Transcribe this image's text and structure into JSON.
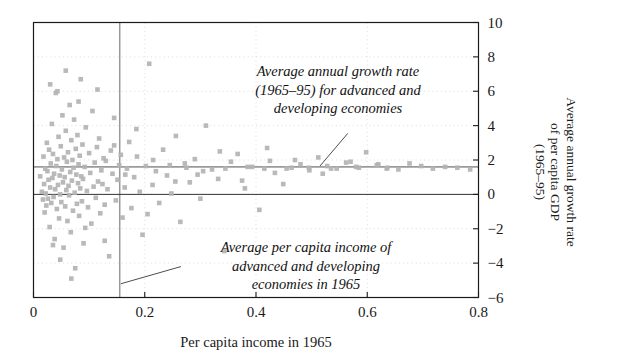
{
  "chart_data": {
    "type": "scatter",
    "title": "",
    "xlabel": "Per capita income in 1965",
    "ylabel": "Average annual growth rate\nof per capita GDP\n(1965–95)",
    "xlim": [
      0,
      0.8
    ],
    "ylim": [
      -6,
      10
    ],
    "xticks": [
      "0",
      "0.2",
      "0.4",
      "0.6",
      "0.8"
    ],
    "xtick_values": [
      0,
      0.2,
      0.4,
      0.6,
      0.8
    ],
    "yticks": [
      "10",
      "8",
      "6",
      "4",
      "2",
      "0",
      "−2",
      "−4",
      "−6"
    ],
    "ytick_values": [
      10,
      8,
      6,
      4,
      2,
      0,
      -2,
      -4,
      -6
    ],
    "grid": "dotted-faint",
    "y_axis_position": "right",
    "marker": "square",
    "marker_color": "#b3b3b3",
    "marker_size": 4.6,
    "reference_lines": [
      {
        "name": "mean-growth-rate-line",
        "orientation": "horizontal",
        "value": 1.6,
        "color": "#9a9a9a"
      },
      {
        "name": "mean-per-capita-income-line",
        "orientation": "vertical",
        "value": 0.155,
        "color": "#9a9a9a"
      },
      {
        "name": "zero-growth-line",
        "orientation": "horizontal",
        "value": 0,
        "color": "#333333"
      }
    ],
    "annotations": [
      {
        "name": "growth-rate-annotation",
        "text": "Average annual growth rate\n(1965–95) for advanced and\ndeveloping economies",
        "leader_from": [
          0.565,
          3.55
        ],
        "leader_to": [
          0.515,
          1.65
        ]
      },
      {
        "name": "income-annotation",
        "text": "Average per capita income of\nadvanced and developing\neconomies in 1965",
        "leader_from": [
          0.265,
          -4.2
        ],
        "leader_to": [
          0.157,
          -5.2
        ]
      }
    ],
    "points": [
      [
        0.012,
        1.05
      ],
      [
        0.015,
        0.15
      ],
      [
        0.017,
        -0.3
      ],
      [
        0.018,
        2.2
      ],
      [
        0.019,
        0.6
      ],
      [
        0.02,
        -1.05
      ],
      [
        0.021,
        1.5
      ],
      [
        0.022,
        0.05
      ],
      [
        0.023,
        -0.65
      ],
      [
        0.024,
        3.0
      ],
      [
        0.025,
        1.35
      ],
      [
        0.026,
        -0.25
      ],
      [
        0.027,
        0.85
      ],
      [
        0.028,
        2.6
      ],
      [
        0.029,
        -1.9
      ],
      [
        0.03,
        0.4
      ],
      [
        0.031,
        1.8
      ],
      [
        0.032,
        -0.5
      ],
      [
        0.033,
        4.1
      ],
      [
        0.034,
        0.95
      ],
      [
        0.035,
        2.35
      ],
      [
        0.036,
        -0.15
      ],
      [
        0.037,
        1.2
      ],
      [
        0.038,
        -2.6
      ],
      [
        0.039,
        0.3
      ],
      [
        0.04,
        5.9
      ],
      [
        0.041,
        1.65
      ],
      [
        0.042,
        -0.85
      ],
      [
        0.043,
        2.05
      ],
      [
        0.044,
        0.55
      ],
      [
        0.045,
        3.35
      ],
      [
        0.046,
        -1.4
      ],
      [
        0.047,
        1.1
      ],
      [
        0.048,
        0.0
      ],
      [
        0.049,
        2.8
      ],
      [
        0.05,
        -0.45
      ],
      [
        0.051,
        1.45
      ],
      [
        0.052,
        4.6
      ],
      [
        0.053,
        0.7
      ],
      [
        0.054,
        -3.1
      ],
      [
        0.055,
        2.15
      ],
      [
        0.056,
        1.0
      ],
      [
        0.057,
        -0.7
      ],
      [
        0.058,
        3.7
      ],
      [
        0.059,
        0.25
      ],
      [
        0.06,
        1.9
      ],
      [
        0.061,
        -1.55
      ],
      [
        0.062,
        2.45
      ],
      [
        0.063,
        0.5
      ],
      [
        0.064,
        -0.05
      ],
      [
        0.065,
        5.2
      ],
      [
        0.066,
        1.3
      ],
      [
        0.067,
        -2.2
      ],
      [
        0.068,
        3.15
      ],
      [
        0.069,
        0.8
      ],
      [
        0.07,
        2.0
      ],
      [
        0.071,
        -0.95
      ],
      [
        0.072,
        1.55
      ],
      [
        0.073,
        4.35
      ],
      [
        0.074,
        0.1
      ],
      [
        0.075,
        -4.3
      ],
      [
        0.076,
        2.65
      ],
      [
        0.077,
        1.15
      ],
      [
        0.078,
        -0.55
      ],
      [
        0.079,
        3.45
      ],
      [
        0.08,
        0.65
      ],
      [
        0.081,
        1.75
      ],
      [
        0.082,
        -1.25
      ],
      [
        0.083,
        2.25
      ],
      [
        0.084,
        0.35
      ],
      [
        0.085,
        6.7
      ],
      [
        0.086,
        1.05
      ],
      [
        0.087,
        -0.4
      ],
      [
        0.088,
        2.9
      ],
      [
        0.089,
        0.9
      ],
      [
        0.09,
        -2.85
      ],
      [
        0.092,
        1.6
      ],
      [
        0.094,
        3.9
      ],
      [
        0.096,
        0.2
      ],
      [
        0.098,
        -0.75
      ],
      [
        0.1,
        2.4
      ],
      [
        0.102,
        1.25
      ],
      [
        0.104,
        -1.7
      ],
      [
        0.106,
        4.85
      ],
      [
        0.108,
        0.45
      ],
      [
        0.11,
        1.85
      ],
      [
        0.112,
        -0.2
      ],
      [
        0.114,
        2.75
      ],
      [
        0.116,
        0.75
      ],
      [
        0.118,
        3.25
      ],
      [
        0.12,
        -1.1
      ],
      [
        0.122,
        1.4
      ],
      [
        0.124,
        0.6
      ],
      [
        0.126,
        2.1
      ],
      [
        0.128,
        -0.6
      ],
      [
        0.13,
        1.95
      ],
      [
        0.133,
        0.3
      ],
      [
        0.136,
        -3.6
      ],
      [
        0.139,
        2.55
      ],
      [
        0.142,
        1.2
      ],
      [
        0.145,
        4.45
      ],
      [
        0.148,
        -0.35
      ],
      [
        0.151,
        0.85
      ],
      [
        0.154,
        1.7
      ],
      [
        0.157,
        2.3
      ],
      [
        0.16,
        -1.35
      ],
      [
        0.164,
        0.4
      ],
      [
        0.168,
        1.5
      ],
      [
        0.172,
        3.05
      ],
      [
        0.176,
        -0.8
      ],
      [
        0.181,
        1.0
      ],
      [
        0.186,
        2.2
      ],
      [
        0.191,
        0.15
      ],
      [
        0.196,
        -2.35
      ],
      [
        0.202,
        1.65
      ],
      [
        0.208,
        7.6
      ],
      [
        0.214,
        0.55
      ],
      [
        0.22,
        1.35
      ],
      [
        0.226,
        -0.5
      ],
      [
        0.233,
        2.6
      ],
      [
        0.24,
        1.1
      ],
      [
        0.248,
        0.05
      ],
      [
        0.256,
        3.4
      ],
      [
        0.264,
        -1.6
      ],
      [
        0.272,
        1.8
      ],
      [
        0.281,
        0.7
      ],
      [
        0.29,
        2.05
      ],
      [
        0.3,
        -0.25
      ],
      [
        0.31,
        4.0
      ],
      [
        0.321,
        1.45
      ],
      [
        0.332,
        0.9
      ],
      [
        0.343,
        -3.3
      ],
      [
        0.355,
        1.9
      ],
      [
        0.367,
        2.35
      ],
      [
        0.38,
        0.35
      ],
      [
        0.393,
        1.6
      ],
      [
        0.406,
        -0.9
      ],
      [
        0.42,
        2.7
      ],
      [
        0.434,
        1.25
      ],
      [
        0.449,
        0.6
      ],
      [
        0.464,
        1.55
      ],
      [
        0.48,
        1.75
      ],
      [
        0.496,
        1.4
      ],
      [
        0.512,
        2.15
      ],
      [
        0.528,
        1.65
      ],
      [
        0.545,
        1.5
      ],
      [
        0.562,
        1.85
      ],
      [
        0.58,
        1.6
      ],
      [
        0.598,
        2.45
      ],
      [
        0.617,
        1.7
      ],
      [
        0.636,
        1.55
      ],
      [
        0.656,
        1.45
      ],
      [
        0.676,
        1.8
      ],
      [
        0.697,
        1.65
      ],
      [
        0.718,
        1.5
      ],
      [
        0.74,
        1.6
      ],
      [
        0.762,
        1.55
      ],
      [
        0.785,
        1.45
      ],
      [
        0.03,
        6.4
      ],
      [
        0.058,
        7.2
      ],
      [
        0.081,
        5.4
      ],
      [
        0.043,
        6.0
      ],
      [
        0.115,
        6.1
      ],
      [
        0.068,
        -4.9
      ],
      [
        0.048,
        -3.8
      ],
      [
        0.035,
        -2.95
      ],
      [
        0.093,
        -1.95
      ],
      [
        0.128,
        -2.7
      ],
      [
        0.205,
        -1.15
      ],
      [
        0.255,
        0.75
      ],
      [
        0.295,
        1.15
      ],
      [
        0.335,
        2.5
      ],
      [
        0.375,
        0.8
      ],
      [
        0.425,
        1.95
      ],
      [
        0.47,
        2.0
      ],
      [
        0.52,
        1.2
      ],
      [
        0.57,
        1.9
      ],
      [
        0.62,
        1.75
      ],
      [
        0.185,
        3.8
      ],
      [
        0.145,
        2.85
      ],
      [
        0.165,
        1.15
      ],
      [
        0.215,
        2.0
      ],
      [
        0.245,
        1.7
      ],
      [
        0.275,
        1.55
      ],
      [
        0.305,
        1.35
      ],
      [
        0.345,
        1.5
      ],
      [
        0.385,
        1.6
      ],
      [
        0.415,
        1.5
      ],
      [
        0.455,
        1.5
      ],
      [
        0.495,
        1.55
      ],
      [
        0.535,
        1.5
      ],
      [
        0.585,
        1.55
      ],
      [
        0.635,
        1.5
      ]
    ]
  },
  "axis": {
    "x_title": "Per capita income in 1965",
    "y_title_line1": "Average annual growth rate",
    "y_title_line2": "of per capita GDP",
    "y_title_line3": "(1965–95)"
  },
  "annotations": {
    "growth": "Average annual growth rate\n(1965–95) for advanced and\ndeveloping economies",
    "income": "Average per capita income of\nadvanced and developing\neconomies in 1965"
  }
}
